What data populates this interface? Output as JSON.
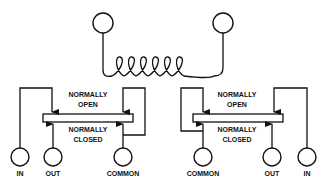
{
  "diagram": {
    "type": "relay-coil-schematic",
    "coil": {
      "turns": 6,
      "terminals": 2
    },
    "left_relay": {
      "labels": {
        "normally_open_line1": "NORMALLY",
        "normally_open_line2": "OPEN",
        "normally_closed_line1": "NORMALLY",
        "normally_closed_line2": "CLOSED"
      },
      "terminals": [
        "IN",
        "OUT",
        "COMMON"
      ]
    },
    "right_relay": {
      "labels": {
        "normally_open_line1": "NORMALLY",
        "normally_open_line2": "OPEN",
        "normally_closed_line1": "NORMALLY",
        "normally_closed_line2": "CLOSED"
      },
      "terminals": [
        "COMMON",
        "OUT",
        "IN"
      ]
    },
    "colors": {
      "line": "#111111",
      "background": "#ffffff"
    }
  }
}
